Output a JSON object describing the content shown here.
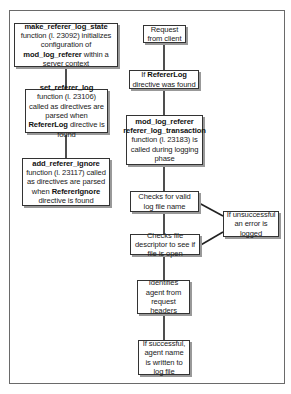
{
  "diagram": {
    "left_column": [
      {
        "id": "make_state",
        "parts": [
          {
            "text": "make_referer_log_state",
            "bold": true
          },
          {
            "text": " function (l. 23092) initializes configuration of ",
            "bold": false
          },
          {
            "text": "mod_log_referer",
            "bold": true
          },
          {
            "text": " within a server context",
            "bold": false
          }
        ]
      },
      {
        "id": "set_log",
        "parts": [
          {
            "text": "set_referer_log",
            "bold": true
          },
          {
            "text": " function (l. 23106) called as directives are parsed when ",
            "bold": false
          },
          {
            "text": "RefererLog",
            "bold": true
          },
          {
            "text": " directive is found",
            "bold": false
          }
        ]
      },
      {
        "id": "add_ignore",
        "parts": [
          {
            "text": "add_referer_ignore",
            "bold": true
          },
          {
            "text": " function (l. 23117) called as directives are parsed when ",
            "bold": false
          },
          {
            "text": "RefererIgnore",
            "bold": true
          },
          {
            "text": " directive is found",
            "bold": false
          }
        ]
      }
    ],
    "right_column": [
      {
        "id": "request",
        "parts": [
          {
            "text": "Request from client",
            "bold": false
          }
        ]
      },
      {
        "id": "if_found",
        "parts": [
          {
            "text": "If ",
            "bold": false
          },
          {
            "text": "RefererLog",
            "bold": true
          },
          {
            "text": " directive was found",
            "bold": false
          }
        ]
      },
      {
        "id": "transaction",
        "parts": [
          {
            "text": "mod_log_referer referer_log_transaction",
            "bold": true
          },
          {
            "text": " function (l. 23183) is called during logging phase",
            "bold": false
          }
        ]
      },
      {
        "id": "check_name",
        "parts": [
          {
            "text": "Checks for valid log file name",
            "bold": false
          }
        ]
      },
      {
        "id": "check_fd",
        "parts": [
          {
            "text": "Checks file descriptor to see if file is open",
            "bold": false
          }
        ]
      },
      {
        "id": "identify",
        "parts": [
          {
            "text": "Identifies agent from request headers",
            "bold": false
          }
        ]
      },
      {
        "id": "write",
        "parts": [
          {
            "text": "If successful, agent name is written to log file",
            "bold": false
          }
        ]
      }
    ],
    "side_box": {
      "id": "error",
      "parts": [
        {
          "text": "If unsuccessful an error is logged",
          "bold": false
        }
      ]
    }
  }
}
